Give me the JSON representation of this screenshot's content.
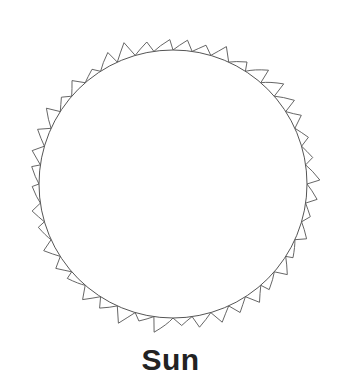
{
  "diagram": {
    "title": "Sun",
    "shape": "circle-with-flame-corona",
    "stroke_color": "#555555",
    "background_color": "#ffffff"
  }
}
